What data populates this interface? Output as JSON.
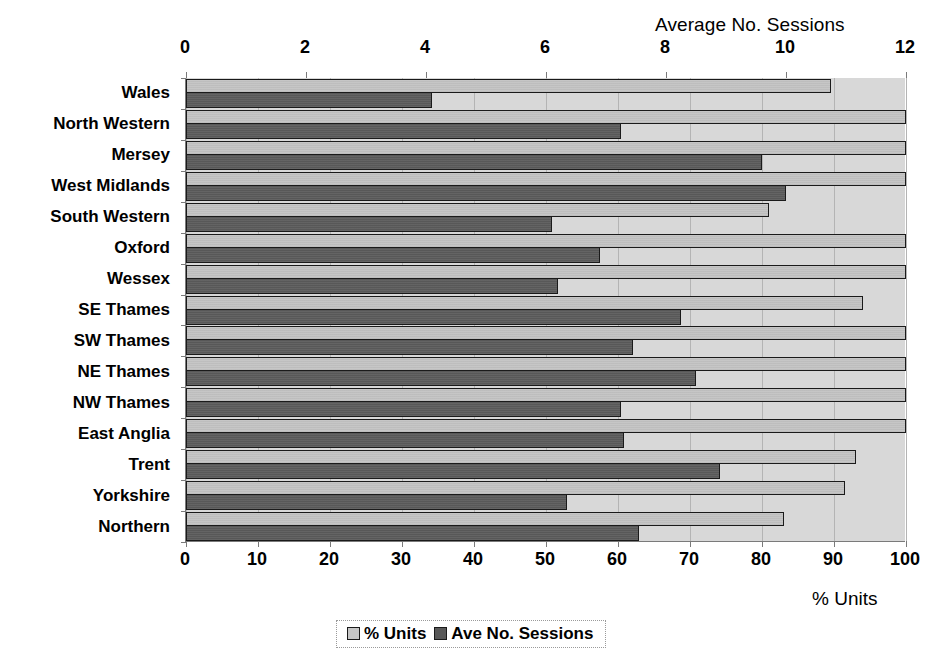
{
  "chart_data": {
    "type": "bar",
    "orientation": "horizontal",
    "title": "",
    "categories": [
      "Wales",
      "North Western",
      "Mersey",
      "West Midlands",
      "South Western",
      "Oxford",
      "Wessex",
      "SE Thames",
      "SW Thames",
      "NE Thames",
      "NW Thames",
      "East Anglia",
      "Trent",
      "Yorkshire",
      "Northern"
    ],
    "series": [
      {
        "name": "% Units",
        "axis": "bottom",
        "color": "#c6c6c6",
        "values": [
          89.6,
          100,
          100,
          100,
          81,
          100,
          100,
          94,
          100,
          100,
          100,
          100,
          93,
          91.5,
          83
        ]
      },
      {
        "name": "Ave No. Sessions",
        "axis": "top",
        "color": "#585858",
        "values": [
          4.1,
          7.25,
          9.6,
          10.0,
          6.1,
          6.9,
          6.2,
          8.25,
          7.45,
          8.5,
          7.25,
          7.3,
          8.9,
          6.35,
          7.55
        ]
      }
    ],
    "top_axis": {
      "label": "Average No. Sessions",
      "ticks": [
        0,
        2,
        4,
        6,
        8,
        10,
        12
      ],
      "range": [
        0,
        12
      ]
    },
    "bottom_axis": {
      "label": "% Units",
      "ticks": [
        0,
        10,
        20,
        30,
        40,
        50,
        60,
        70,
        80,
        90,
        100
      ],
      "range": [
        0,
        100
      ]
    },
    "ylabel": "",
    "grid": true,
    "legend": {
      "position": "bottom-center",
      "entries": [
        "% Units",
        "Ave No. Sessions"
      ]
    },
    "plot_background": "#d8d8d8"
  },
  "top_axis_title": "Average No. Sessions",
  "bottom_axis_title": "% Units",
  "top_ticks": [
    "0",
    "2",
    "4",
    "6",
    "8",
    "10",
    "12"
  ],
  "bottom_ticks": [
    "0",
    "10",
    "20",
    "30",
    "40",
    "50",
    "60",
    "70",
    "80",
    "90",
    "100"
  ],
  "legend": {
    "units_label": "% Units",
    "sessions_label": "Ave No. Sessions"
  }
}
